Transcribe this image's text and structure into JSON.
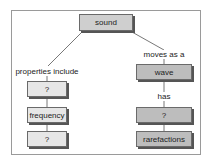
{
  "diagram": {
    "type": "concept-map",
    "root": {
      "label": "sound"
    },
    "left_branch": {
      "link_label": "properties include",
      "nodes": [
        {
          "label": "?"
        },
        {
          "label": "frequency"
        },
        {
          "label": "?"
        }
      ]
    },
    "right_branch": {
      "link_label": "moves as a",
      "nodes": [
        {
          "label": "wave"
        },
        {
          "label": "?"
        },
        {
          "label": "rarefactions"
        }
      ],
      "sub_link_label": "has"
    },
    "colors": {
      "frame": "#9a9a9a",
      "node_border": "#6a6a6a",
      "node_shadow": "#555555",
      "left_fill": "#e6e6e6",
      "right_fill": "#bdbdbd",
      "root_fill": "#cfcfcf",
      "line": "#555555"
    }
  }
}
